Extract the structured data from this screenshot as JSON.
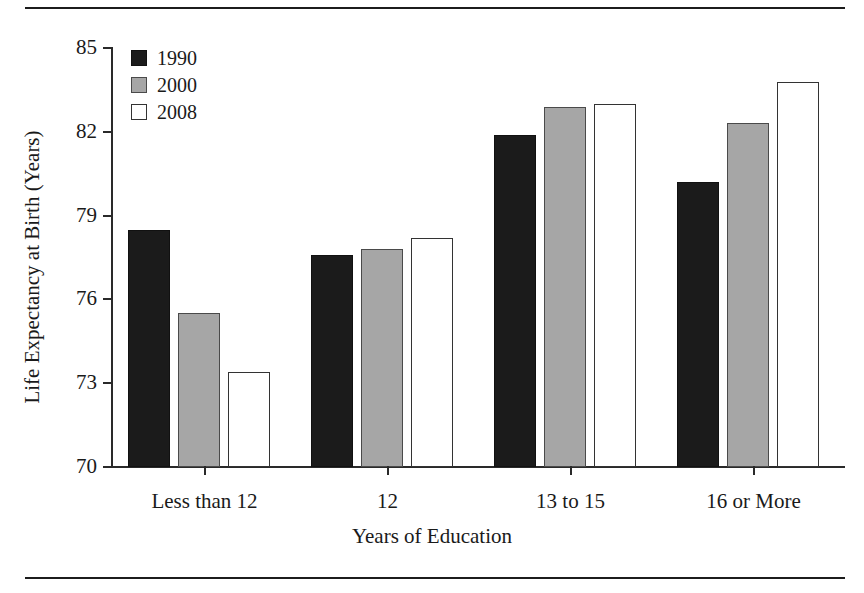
{
  "chart_data": {
    "type": "bar",
    "title": "",
    "xlabel": "Years of Education",
    "ylabel": "Life Expectancy at Birth (Years)",
    "categories": [
      "Less than 12",
      "12",
      "13 to 15",
      "16 or More"
    ],
    "series": [
      {
        "name": "1990",
        "color": "#1b1b1b",
        "values": [
          78.5,
          77.6,
          81.9,
          80.2
        ]
      },
      {
        "name": "2000",
        "color": "#a6a6a6",
        "values": [
          75.5,
          77.8,
          82.9,
          82.3
        ]
      },
      {
        "name": "2008",
        "color": "#ffffff",
        "values": [
          73.4,
          78.2,
          83.0,
          83.8
        ]
      }
    ],
    "ylim": [
      70,
      85
    ],
    "yticks": [
      70,
      73,
      76,
      79,
      82,
      85
    ],
    "ytick_labels": [
      "70",
      "73",
      "76",
      "79",
      "82",
      "85"
    ],
    "grid": false,
    "legend_position": "top-left"
  },
  "legend": {
    "items": [
      {
        "label": "1990"
      },
      {
        "label": "2000"
      },
      {
        "label": "2008"
      }
    ]
  },
  "axes": {
    "y_title": "Life Expectancy at Birth (Years)",
    "x_title": "Years of Education"
  }
}
